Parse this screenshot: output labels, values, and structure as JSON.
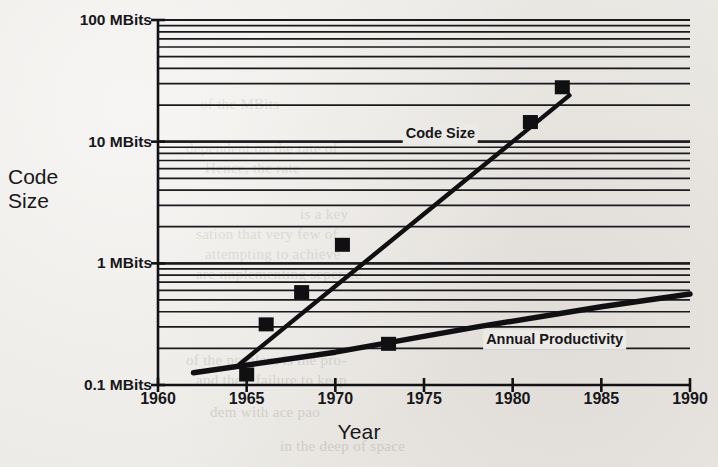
{
  "figure": {
    "y_axis_title_line1": "Code",
    "y_axis_title_line2": "Size",
    "x_axis_title": "Year"
  },
  "chart_data": {
    "type": "line",
    "title": "",
    "xlabel": "Year",
    "ylabel": "Code Size",
    "yscale": "log",
    "ylim": [
      0.1,
      100
    ],
    "xlim": [
      1960,
      1990
    ],
    "grid": true,
    "legend_position": "inline-annotations",
    "y_tick_labels": [
      "100 MBits",
      "10 MBits",
      "1 MBits",
      "0.1 MBits"
    ],
    "y_tick_values": [
      100,
      10,
      1,
      0.1
    ],
    "y_unit": "MBits",
    "x_tick_labels": [
      "1960",
      "1965",
      "1970",
      "1975",
      "1980",
      "1985",
      "1990"
    ],
    "x_tick_values": [
      1960,
      1965,
      1970,
      1975,
      1980,
      1985,
      1990
    ],
    "series": [
      {
        "name": "Code Size",
        "label": "Code Size",
        "line": [
          {
            "x": 1964.6,
            "y": 0.148
          },
          {
            "x": 1983.2,
            "y": 24.0
          }
        ],
        "points": [
          {
            "x": 1965.0,
            "y": 0.122
          },
          {
            "x": 1966.1,
            "y": 0.315
          },
          {
            "x": 1968.1,
            "y": 0.58
          },
          {
            "x": 1970.4,
            "y": 1.42
          },
          {
            "x": 1981.0,
            "y": 14.5
          },
          {
            "x": 1982.8,
            "y": 28.0
          }
        ]
      },
      {
        "name": "Annual Productivity",
        "label": "Annual Productivity",
        "line": [
          {
            "x": 1962.0,
            "y": 0.126
          },
          {
            "x": 1970.0,
            "y": 0.186
          },
          {
            "x": 1978.0,
            "y": 0.3
          },
          {
            "x": 1985.0,
            "y": 0.44
          },
          {
            "x": 1990.0,
            "y": 0.56
          }
        ],
        "points": [
          {
            "x": 1973.0,
            "y": 0.218
          }
        ]
      }
    ],
    "annotations": [
      {
        "text": "Code Size",
        "x": 1976.0,
        "y": 11.5
      },
      {
        "text": "Annual Productivity",
        "x": 1982.0,
        "y": 0.236
      }
    ]
  },
  "scan_artifacts": {
    "ghost_lines": [
      {
        "text": "of the MBits",
        "x": 200,
        "y": 96
      },
      {
        "text": "dependent on the rate of",
        "x": 186,
        "y": 140
      },
      {
        "text": "Hence, the rate",
        "x": 205,
        "y": 160
      },
      {
        "text": "is a key",
        "x": 300,
        "y": 206
      },
      {
        "text": "sation that very few of",
        "x": 196,
        "y": 226
      },
      {
        "text": "attempting to achieve",
        "x": 205,
        "y": 246
      },
      {
        "text": "are implementing seperate",
        "x": 196,
        "y": 266
      },
      {
        "text": "of the problem is the pro-",
        "x": 186,
        "y": 352
      },
      {
        "text": "and their failure to keep",
        "x": 196,
        "y": 372
      },
      {
        "text": "dem with ace pao",
        "x": 210,
        "y": 404
      },
      {
        "text": "in the deep of space",
        "x": 280,
        "y": 438
      }
    ]
  }
}
